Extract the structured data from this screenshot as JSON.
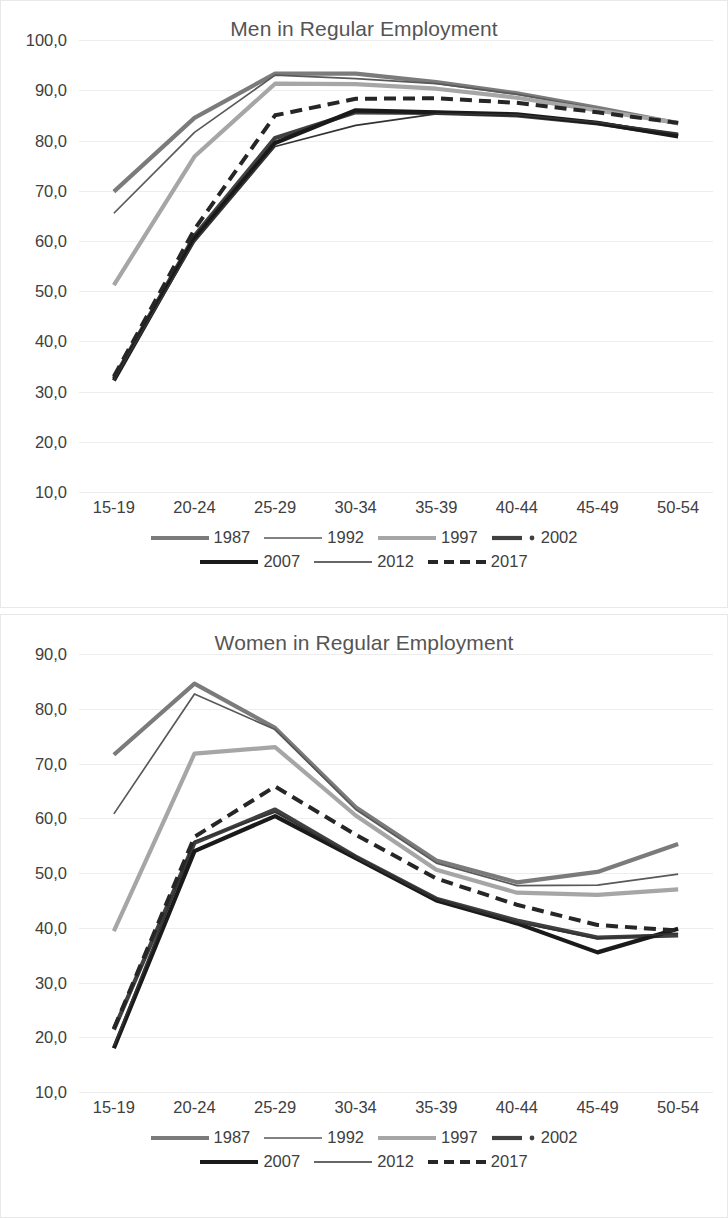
{
  "page": {
    "background": "#ffffff",
    "text_color": "#3f3f3f"
  },
  "charts": [
    {
      "id": "men",
      "title": "Men in Regular Employment"
    },
    {
      "id": "women",
      "title": "Women in Regular Employment"
    }
  ],
  "legend": {
    "rows": [
      [
        {
          "label": "1987",
          "style": "thick",
          "color": "#7b7b7b",
          "marker": "none"
        },
        {
          "label": "1992",
          "style": "thin",
          "color": "#595959",
          "marker": "none"
        },
        {
          "label": "1997",
          "style": "thick",
          "color": "#a6a6a6",
          "marker": "none"
        },
        {
          "label": "2002",
          "style": "thick",
          "color": "#404040",
          "marker": "dot"
        }
      ],
      [
        {
          "label": "2007",
          "style": "thick",
          "color": "#1a1a1a",
          "marker": "none"
        },
        {
          "label": "2012",
          "style": "thin",
          "color": "#333333",
          "marker": "none"
        },
        {
          "label": "2017",
          "style": "dashed",
          "color": "#262626",
          "marker": "none"
        }
      ]
    ]
  },
  "chart_data": [
    {
      "type": "line",
      "title": "Men in Regular Employment",
      "xlabel": "",
      "ylabel": "",
      "categories": [
        "15-19",
        "20-24",
        "25-29",
        "30-34",
        "35-39",
        "40-44",
        "45-49",
        "50-54"
      ],
      "ylim": [
        10.0,
        100.0
      ],
      "ytick_step": 10.0,
      "ytick_labels": [
        "10,0",
        "20,0",
        "30,0",
        "40,0",
        "50,0",
        "60,0",
        "70,0",
        "80,0",
        "90,0",
        "100,0"
      ],
      "grid": true,
      "legend_position": "bottom",
      "series": [
        {
          "name": "1987",
          "color": "#7b7b7b",
          "style": "thick",
          "values": [
            69.8,
            84.5,
            93.3,
            93.3,
            91.6,
            89.4,
            86.5,
            83.4
          ]
        },
        {
          "name": "1992",
          "color": "#595959",
          "style": "thin",
          "values": [
            65.5,
            81.6,
            93.0,
            92.3,
            91.3,
            89.2,
            86.3,
            83.3
          ]
        },
        {
          "name": "1997",
          "color": "#a6a6a6",
          "style": "thick",
          "values": [
            51.2,
            76.8,
            91.3,
            91.2,
            90.3,
            88.5,
            86.0,
            83.5
          ]
        },
        {
          "name": "2002",
          "color": "#404040",
          "style": "thick",
          "values": [
            32.6,
            61.0,
            80.5,
            85.6,
            85.5,
            85.0,
            83.4,
            81.0
          ]
        },
        {
          "name": "2007",
          "color": "#1a1a1a",
          "style": "thick",
          "values": [
            32.2,
            60.5,
            79.5,
            86.0,
            85.6,
            85.2,
            83.5,
            80.8
          ]
        },
        {
          "name": "2012",
          "color": "#333333",
          "style": "thin",
          "values": [
            32.3,
            59.8,
            78.8,
            83.0,
            85.3,
            85.1,
            83.6,
            81.4
          ]
        },
        {
          "name": "2017",
          "color": "#262626",
          "style": "dashed",
          "values": [
            33.0,
            62.3,
            85.0,
            88.3,
            88.4,
            87.5,
            85.6,
            83.5
          ]
        }
      ]
    },
    {
      "type": "line",
      "title": "Women in Regular Employment",
      "xlabel": "",
      "ylabel": "",
      "categories": [
        "15-19",
        "20-24",
        "25-29",
        "30-34",
        "35-39",
        "40-44",
        "45-49",
        "50-54"
      ],
      "ylim": [
        10.0,
        90.0
      ],
      "ytick_step": 10.0,
      "ytick_labels": [
        "10,0",
        "20,0",
        "30,0",
        "40,0",
        "50,0",
        "60,0",
        "70,0",
        "80,0",
        "90,0"
      ],
      "grid": true,
      "legend_position": "bottom",
      "series": [
        {
          "name": "1987",
          "color": "#7b7b7b",
          "style": "thick",
          "values": [
            71.6,
            84.6,
            76.5,
            62.0,
            52.3,
            48.3,
            50.2,
            55.3
          ]
        },
        {
          "name": "1992",
          "color": "#595959",
          "style": "thin",
          "values": [
            60.8,
            82.7,
            76.2,
            61.6,
            51.8,
            47.7,
            47.8,
            49.8
          ]
        },
        {
          "name": "1997",
          "color": "#a6a6a6",
          "style": "thick",
          "values": [
            39.4,
            71.8,
            73.0,
            60.5,
            50.6,
            46.4,
            46.0,
            47.0
          ]
        },
        {
          "name": "2002",
          "color": "#404040",
          "style": "thick",
          "values": [
            21.4,
            55.5,
            61.6,
            53.0,
            45.3,
            41.3,
            38.2,
            38.6
          ]
        },
        {
          "name": "2007",
          "color": "#1a1a1a",
          "style": "thick",
          "values": [
            18.0,
            54.0,
            60.4,
            52.7,
            45.0,
            40.8,
            35.5,
            39.8
          ]
        },
        {
          "name": "2012",
          "color": "#333333",
          "style": "thin",
          "values": [
            18.4,
            55.8,
            61.1,
            52.9,
            45.2,
            41.0,
            38.0,
            39.0
          ]
        },
        {
          "name": "2017",
          "color": "#262626",
          "style": "dashed",
          "values": [
            21.6,
            56.6,
            65.8,
            57.0,
            49.0,
            44.2,
            40.5,
            39.5
          ]
        }
      ]
    }
  ]
}
